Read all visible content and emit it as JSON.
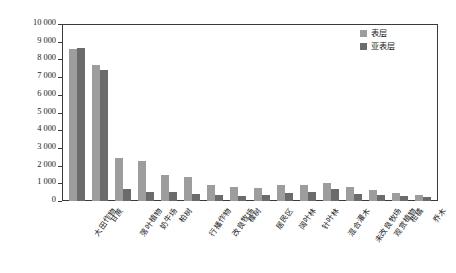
{
  "chart_data": {
    "type": "bar",
    "title": "",
    "xlabel": "",
    "ylabel": "全氮含量(mg·kg⁻¹)",
    "ylim": [
      0,
      10000
    ],
    "yticks": [
      "0",
      "1 000",
      "2 000",
      "3 000",
      "4 000",
      "5 000",
      "6 000",
      "7 000",
      "8 000",
      "9 000",
      "10 000"
    ],
    "grid": false,
    "legend_position": "top-right",
    "categories": [
      "大田作物",
      "甘蔗",
      "落叶植物",
      "奶牛场",
      "柏树",
      "行播作物",
      "改良牧场",
      "橡树",
      "居民区",
      "阔叶林",
      "针叶林",
      "混合灌木",
      "未改良牧场",
      "观赏植物",
      "柑橘",
      "乔木"
    ],
    "series": [
      {
        "name": "表层",
        "color": "#9d9d9d",
        "values": [
          8600,
          7700,
          2420,
          2250,
          1490,
          1370,
          930,
          790,
          750,
          880,
          900,
          1020,
          800,
          640,
          460,
          330
        ]
      },
      {
        "name": "亚表层",
        "color": "#6b6b6b",
        "values": [
          8620,
          7430,
          660,
          520,
          510,
          400,
          320,
          300,
          330,
          480,
          530,
          680,
          390,
          360,
          260,
          230
        ]
      }
    ]
  },
  "legend": {
    "items": [
      {
        "label": "表层"
      },
      {
        "label": "亚表层"
      }
    ]
  },
  "colors": {
    "surface": "#9d9d9d",
    "subsurface": "#6b6b6b",
    "axis": "#3a3a3a"
  }
}
